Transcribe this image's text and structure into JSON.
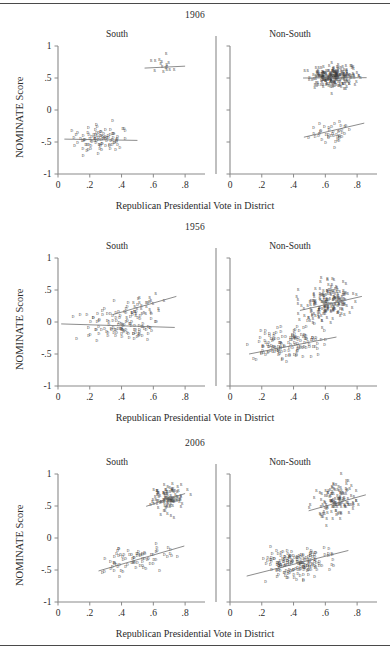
{
  "figure": {
    "ylabel": "NOMINATE Score",
    "xlabel": "Republican Presidential Vote in District",
    "panel_labels": {
      "south": "South",
      "nonsouth": "Non-South"
    },
    "marker_democrat": "D",
    "marker_republican": "R",
    "colors": {
      "axis": "#8a8a8a",
      "marker": "#3a3a3a",
      "fit": "#6e6e6e",
      "rule": "#4a4a4a"
    }
  },
  "chart_data": {
    "type": "scatter",
    "title": "",
    "xlabel": "Republican Presidential Vote in District",
    "ylabel": "NOMINATE Score",
    "xlim": [
      0,
      0.9
    ],
    "ylim": [
      -1,
      1
    ],
    "xticks": [
      0,
      0.2,
      0.4,
      0.6,
      0.8
    ],
    "xticklabels": [
      "0",
      ".2",
      ".4",
      ".6",
      ".8"
    ],
    "yticks": [
      1,
      0.5,
      0,
      -0.5,
      -1
    ],
    "yticklabels": [
      "1",
      ".5",
      "0",
      "-.5",
      "-1"
    ],
    "grid": false,
    "legend": "none",
    "marker_labels": {
      "D": "Democrat",
      "R": "Republican"
    },
    "panels": [
      {
        "year": "1906",
        "row": 0,
        "facets": [
          {
            "name": "South",
            "series": [
              {
                "name": "D",
                "n": 96,
                "x_range": [
                  0.03,
                  0.5
                ],
                "y_mean": -0.47,
                "y_sd": 0.1,
                "fit": {
                  "x0": 0.04,
                  "y0": -0.455,
                  "x1": 0.5,
                  "y1": -0.475
                },
                "seed": 101
              },
              {
                "name": "R",
                "n": 16,
                "x_range": [
                  0.54,
                  0.8
                ],
                "y_mean": 0.66,
                "y_sd": 0.07,
                "fit": {
                  "x0": 0.545,
                  "y0": 0.655,
                  "x1": 0.8,
                  "y1": 0.685
                },
                "seed": 102
              }
            ]
          },
          {
            "name": "Non-South",
            "series": [
              {
                "name": "D",
                "n": 44,
                "x_range": [
                  0.46,
                  0.84
                ],
                "y_mean": -0.38,
                "y_sd": 0.09,
                "fit": {
                  "x0": 0.465,
                  "y0": -0.425,
                  "x1": 0.845,
                  "y1": -0.205
                },
                "seed": 103
              },
              {
                "name": "R",
                "n": 245,
                "x_range": [
                  0.44,
                  0.87
                ],
                "y_mean": 0.5,
                "y_sd": 0.085,
                "fit": {
                  "x0": 0.46,
                  "y0": 0.5,
                  "x1": 0.86,
                  "y1": 0.505
                },
                "seed": 104
              }
            ]
          }
        ]
      },
      {
        "year": "1956",
        "row": 1,
        "facets": [
          {
            "name": "South",
            "series": [
              {
                "name": "D",
                "n": 118,
                "x_range": [
                  0.02,
                  0.73
                ],
                "y_mean": -0.07,
                "y_sd": 0.14,
                "fit": {
                  "x0": 0.02,
                  "y0": -0.03,
                  "x1": 0.735,
                  "y1": -0.085
                },
                "seed": 201
              },
              {
                "name": "R",
                "n": 30,
                "x_range": [
                  0.34,
                  0.74
                ],
                "y_mean": 0.2,
                "y_sd": 0.12,
                "fit": {
                  "x0": 0.345,
                  "y0": 0.115,
                  "x1": 0.745,
                  "y1": 0.4
                },
                "seed": 202
              }
            ]
          },
          {
            "name": "Non-South",
            "series": [
              {
                "name": "D",
                "n": 145,
                "x_range": [
                  0.05,
                  0.68
                ],
                "y_mean": -0.3,
                "y_sd": 0.13,
                "fit": {
                  "x0": 0.12,
                  "y0": -0.5,
                  "x1": 0.67,
                  "y1": -0.235
                },
                "seed": 203
              },
              {
                "name": "R",
                "n": 200,
                "x_range": [
                  0.39,
                  0.84
                ],
                "y_mean": 0.28,
                "y_sd": 0.16,
                "fit": {
                  "x0": 0.44,
                  "y0": 0.18,
                  "x1": 0.83,
                  "y1": 0.4
                },
                "seed": 204
              }
            ]
          }
        ]
      },
      {
        "year": "2006",
        "row": 2,
        "facets": [
          {
            "name": "South",
            "series": [
              {
                "name": "D",
                "n": 78,
                "x_range": [
                  0.18,
                  0.8
                ],
                "y_mean": -0.37,
                "y_sd": 0.1,
                "fit": {
                  "x0": 0.255,
                  "y0": -0.515,
                  "x1": 0.795,
                  "y1": -0.125
                },
                "seed": 301
              },
              {
                "name": "R",
                "n": 112,
                "x_range": [
                  0.55,
                  0.85
                ],
                "y_mean": 0.6,
                "y_sd": 0.11,
                "fit": {
                  "x0": 0.555,
                  "y0": 0.495,
                  "x1": 0.8,
                  "y1": 0.695
                },
                "seed": 302
              }
            ]
          },
          {
            "name": "Non-South",
            "series": [
              {
                "name": "D",
                "n": 185,
                "x_range": [
                  0.1,
                  0.74
                ],
                "y_mean": -0.42,
                "y_sd": 0.11,
                "fit": {
                  "x0": 0.105,
                  "y0": -0.595,
                  "x1": 0.745,
                  "y1": -0.195
                },
                "seed": 303
              },
              {
                "name": "R",
                "n": 135,
                "x_range": [
                  0.48,
                  0.86
                ],
                "y_mean": 0.58,
                "y_sd": 0.13,
                "fit": {
                  "x0": 0.495,
                  "y0": 0.425,
                  "x1": 0.855,
                  "y1": 0.675
                },
                "seed": 304
              }
            ]
          }
        ]
      }
    ]
  }
}
